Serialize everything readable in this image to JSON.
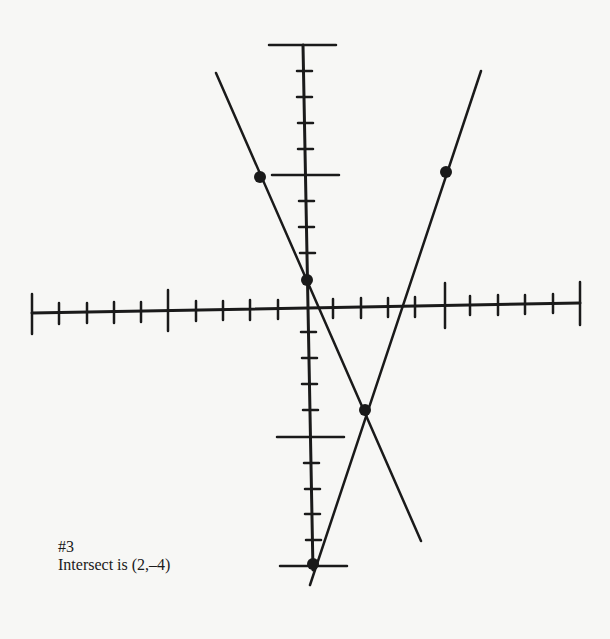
{
  "figure": {
    "label": "#3",
    "caption": "Intersect is (2,–4)"
  },
  "graph": {
    "x_range": [
      -10,
      10
    ],
    "y_range": [
      -10,
      10
    ],
    "major_tick_every": 5,
    "lines": [
      {
        "name": "line-a",
        "points": [
          [
            -2,
            5
          ],
          [
            0,
            1
          ]
        ],
        "description": "decreasing line through (-2,5) and (0,1)"
      },
      {
        "name": "line-b",
        "points": [
          [
            0,
            -10
          ],
          [
            5,
            5
          ]
        ],
        "description": "increasing line through (0,-10) and (5,5)"
      }
    ],
    "intersection": [
      2,
      -4
    ],
    "color": "#1a1a1a"
  }
}
